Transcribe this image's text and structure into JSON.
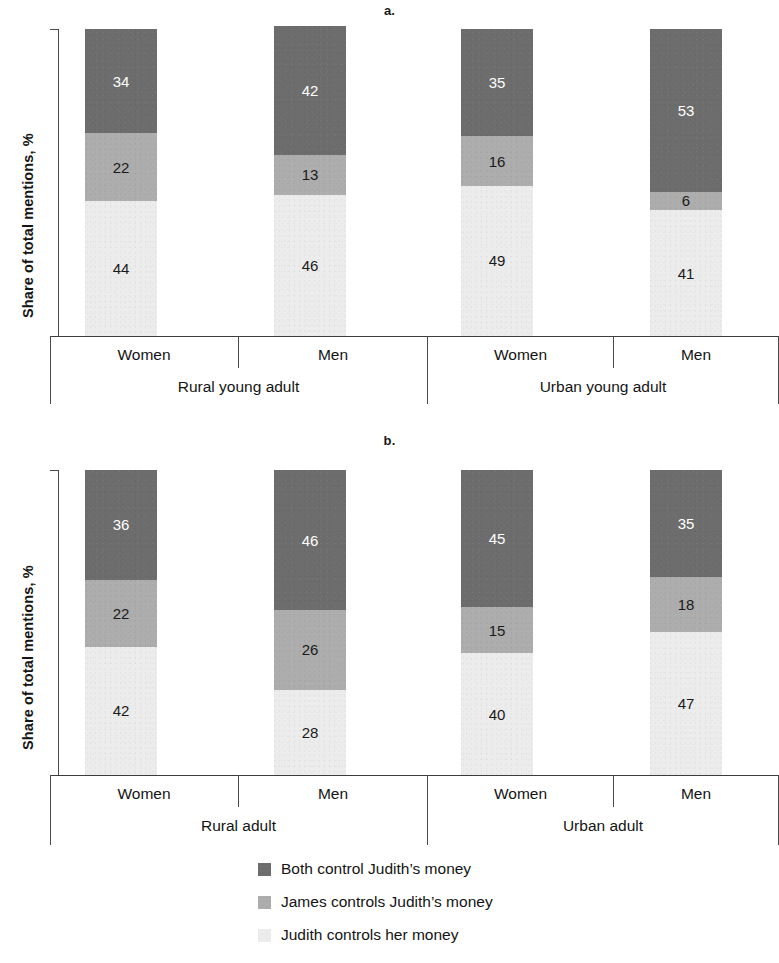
{
  "figure": {
    "panel_a_title": "a.",
    "panel_b_title": "b.",
    "y_axis_label": "Share of total mentions, %"
  },
  "legend": {
    "items": [
      {
        "label": "Both control Judith’s money",
        "color": "#6d6d6d",
        "key": "both"
      },
      {
        "label": "James controls Judith’s money",
        "color": "#adadad",
        "key": "james"
      },
      {
        "label": "Judith controls her money",
        "color": "#ececec",
        "key": "judith"
      }
    ]
  },
  "axis": {
    "category_labels": [
      "Women",
      "Men",
      "Women",
      "Men"
    ],
    "group_labels_a": [
      "Rural young adult",
      "Urban young adult"
    ],
    "group_labels_b": [
      "Rural adult",
      "Urban  adult"
    ]
  },
  "chart_data": [
    {
      "type": "bar",
      "id": "a",
      "title": "a.",
      "stacked": true,
      "xlabel": "",
      "ylabel": "Share of total mentions, %",
      "ylim": [
        0,
        100
      ],
      "grid": false,
      "legend_position": "bottom",
      "groups": [
        "Rural young adult",
        "Urban young adult"
      ],
      "categories": [
        "Women",
        "Men",
        "Women",
        "Men"
      ],
      "series": [
        {
          "name": "Both control Judith’s money",
          "color": "#6d6d6d",
          "values": [
            34,
            42,
            35,
            53
          ]
        },
        {
          "name": "James controls Judith’s money",
          "color": "#adadad",
          "values": [
            22,
            13,
            16,
            6
          ]
        },
        {
          "name": "Judith controls her money",
          "color": "#ececec",
          "values": [
            44,
            46,
            49,
            41
          ]
        }
      ]
    },
    {
      "type": "bar",
      "id": "b",
      "title": "b.",
      "stacked": true,
      "xlabel": "",
      "ylabel": "Share of total mentions, %",
      "ylim": [
        0,
        100
      ],
      "grid": false,
      "legend_position": "bottom",
      "groups": [
        "Rural adult",
        "Urban  adult"
      ],
      "categories": [
        "Women",
        "Men",
        "Women",
        "Men"
      ],
      "series": [
        {
          "name": "Both control Judith’s money",
          "color": "#6d6d6d",
          "values": [
            36,
            46,
            45,
            35
          ]
        },
        {
          "name": "James controls Judith’s money",
          "color": "#adadad",
          "values": [
            22,
            26,
            15,
            18
          ]
        },
        {
          "name": "Judith controls her money",
          "color": "#ececec",
          "values": [
            42,
            28,
            40,
            47
          ]
        }
      ]
    }
  ]
}
